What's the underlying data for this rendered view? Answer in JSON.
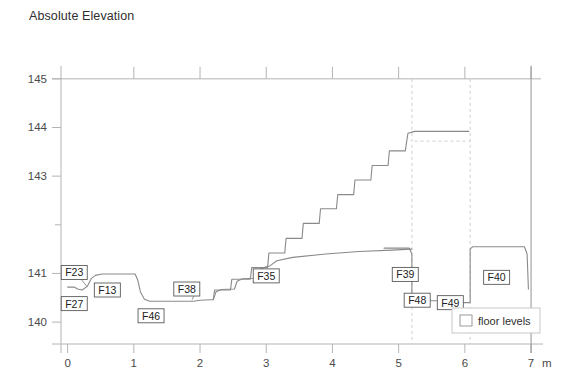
{
  "figure": {
    "axis_title": "Absolute\nElevation",
    "background": "#ffffff",
    "line_color": "#8a8a8a",
    "axis_color": "#b4b4b4",
    "dashed_color": "#cfcfcf",
    "text_color": "#3a3a3a"
  },
  "legend": {
    "label": "floor levels",
    "swatch_fill": "#ffffff",
    "swatch_stroke": "#9a9a9a"
  },
  "chart_data": {
    "type": "line",
    "title": "Absolute Elevation",
    "xlabel": "m",
    "ylabel": "Absolute Elevation",
    "xlim": [
      -0.1,
      7.15
    ],
    "ylim": [
      139.55,
      145.12
    ],
    "grid": false,
    "legend_position": "bottom-right",
    "x_ticks": [
      "0",
      "1",
      "2",
      "3",
      "4",
      "5",
      "6",
      "7"
    ],
    "x_tick_values": [
      0,
      1,
      2,
      3,
      4,
      5,
      6,
      7
    ],
    "x_unit": "m",
    "y_ticks": [
      "145",
      "144",
      "143",
      "141",
      "140"
    ],
    "y_tick_values": [
      145,
      144,
      143,
      141,
      140
    ],
    "y_minor_tick_values": [
      142
    ],
    "series": [
      {
        "name": "floor levels",
        "comment": "stepped floor-level profile; x in metres, y in metres absolute elevation",
        "points": [
          [
            0.0,
            140.72
          ],
          [
            0.1,
            140.72
          ],
          [
            0.15,
            140.68
          ],
          [
            0.22,
            140.66
          ],
          [
            0.3,
            140.74
          ],
          [
            0.36,
            140.9
          ],
          [
            0.42,
            140.96
          ],
          [
            0.52,
            140.99
          ],
          [
            1.02,
            140.99
          ],
          [
            1.06,
            140.86
          ],
          [
            1.1,
            140.62
          ],
          [
            1.16,
            140.47
          ],
          [
            1.24,
            140.43
          ],
          [
            1.9,
            140.43
          ],
          [
            2.0,
            140.45
          ],
          [
            2.16,
            140.46
          ],
          [
            2.2,
            140.46
          ],
          [
            2.24,
            140.62
          ],
          [
            2.32,
            140.67
          ],
          [
            2.52,
            140.68
          ],
          [
            2.56,
            140.84
          ],
          [
            2.64,
            140.89
          ],
          [
            2.82,
            140.9
          ],
          [
            2.88,
            141.06
          ],
          [
            2.96,
            141.12
          ],
          [
            3.06,
            141.16
          ],
          [
            3.16,
            141.26
          ],
          [
            3.4,
            141.33
          ],
          [
            3.9,
            141.4
          ],
          [
            4.4,
            141.45
          ],
          [
            4.9,
            141.48
          ],
          [
            5.18,
            141.5
          ],
          [
            5.2,
            141.5
          ]
        ]
      },
      {
        "name": "staircase",
        "comment": "rising stair treads between ~2.2 m and ~5.2 m",
        "points": [
          [
            2.2,
            140.46
          ],
          [
            2.22,
            140.66
          ],
          [
            2.46,
            140.66
          ],
          [
            2.48,
            140.88
          ],
          [
            2.76,
            140.88
          ],
          [
            2.78,
            141.12
          ],
          [
            3.02,
            141.12
          ],
          [
            3.04,
            141.42
          ],
          [
            3.28,
            141.42
          ],
          [
            3.3,
            141.72
          ],
          [
            3.54,
            141.72
          ],
          [
            3.56,
            142.03
          ],
          [
            3.8,
            142.03
          ],
          [
            3.82,
            142.33
          ],
          [
            4.06,
            142.33
          ],
          [
            4.08,
            142.62
          ],
          [
            4.32,
            142.62
          ],
          [
            4.34,
            142.92
          ],
          [
            4.58,
            142.92
          ],
          [
            4.6,
            143.22
          ],
          [
            4.84,
            143.22
          ],
          [
            4.86,
            143.52
          ],
          [
            5.1,
            143.52
          ],
          [
            5.14,
            143.88
          ],
          [
            5.24,
            143.92
          ],
          [
            6.06,
            143.92
          ]
        ]
      },
      {
        "name": "lower-rooms",
        "comment": "F39 / F48 / F49 / F40 room floor outlines below the stair",
        "points": [
          [
            4.78,
            141.52
          ],
          [
            5.16,
            141.52
          ],
          [
            5.2,
            141.4
          ],
          [
            5.2,
            140.44
          ],
          [
            5.92,
            140.44
          ],
          [
            5.96,
            140.4
          ],
          [
            6.08,
            140.4
          ],
          [
            6.08,
            141.5
          ],
          [
            6.12,
            141.55
          ],
          [
            6.9,
            141.55
          ],
          [
            6.94,
            141.4
          ],
          [
            6.96,
            140.68
          ]
        ]
      }
    ],
    "annotations": [
      {
        "label": "F23",
        "x": 0.1,
        "y": 141.02,
        "leader": true,
        "leader_to": [
          0.3,
          140.72
        ]
      },
      {
        "label": "F27",
        "x": 0.1,
        "y": 140.38,
        "leader": false,
        "leader_to": null
      },
      {
        "label": "F13",
        "x": 0.6,
        "y": 140.66,
        "leader": false,
        "leader_to": null
      },
      {
        "label": "F46",
        "x": 1.26,
        "y": 140.13,
        "leader": false,
        "leader_to": null
      },
      {
        "label": "F38",
        "x": 1.8,
        "y": 140.68,
        "leader": true,
        "leader_to": [
          1.88,
          140.46
        ]
      },
      {
        "label": "F35",
        "x": 3.0,
        "y": 140.95,
        "leader": false,
        "leader_to": null
      },
      {
        "label": "F39",
        "x": 5.1,
        "y": 140.98,
        "leader": false,
        "leader_to": null
      },
      {
        "label": "F48",
        "x": 5.28,
        "y": 140.45,
        "leader": false,
        "leader_to": null
      },
      {
        "label": "F49",
        "x": 5.78,
        "y": 140.4,
        "leader": false,
        "leader_to": null
      },
      {
        "label": "F40",
        "x": 6.48,
        "y": 140.92,
        "leader": false,
        "leader_to": null
      }
    ],
    "dashed_verticals": [
      5.2,
      6.08,
      7.0
    ],
    "dashed_horizontals": [
      {
        "y": 143.72,
        "x_from": 5.24,
        "x_to": 6.08
      }
    ]
  }
}
